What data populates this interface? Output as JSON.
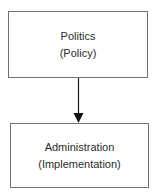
{
  "diagram": {
    "type": "flow",
    "nodes": [
      {
        "id": "politics",
        "lines": [
          "Politics",
          "(Policy)"
        ]
      },
      {
        "id": "administration",
        "lines": [
          "Administration",
          "(Implementation)"
        ]
      }
    ],
    "edges": [
      {
        "from": "politics",
        "to": "administration",
        "style": "arrow"
      }
    ],
    "colors": {
      "border": "#6f6f6f",
      "arrow": "#1a1a1a",
      "text": "#2b2b2b",
      "background": "#ffffff"
    }
  }
}
